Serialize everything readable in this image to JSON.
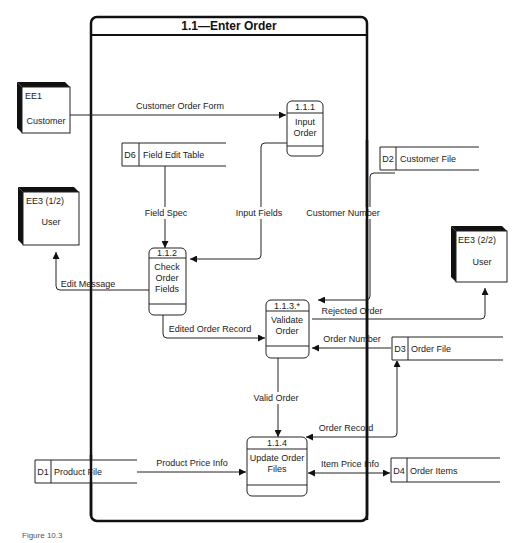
{
  "diagram": {
    "title": "1.1—Enter Order",
    "caption": "Figure 10.3"
  },
  "external_entities": [
    {
      "id": "EE1",
      "name": "Customer"
    },
    {
      "id": "EE3 (1/2)",
      "name": "User"
    },
    {
      "id": "EE3 (2/2)",
      "name": "User"
    }
  ],
  "processes": [
    {
      "id": "1.1.1",
      "name_lines": [
        "Input",
        "Order"
      ]
    },
    {
      "id": "1.1.2",
      "name_lines": [
        "Check",
        "Order",
        "Fields"
      ]
    },
    {
      "id": "1.1.3.*",
      "name_lines": [
        "Validate",
        "Order"
      ]
    },
    {
      "id": "1.1.4",
      "name_lines": [
        "Update Order",
        "Files"
      ]
    }
  ],
  "data_stores": [
    {
      "id": "D6",
      "name": "Field Edit Table"
    },
    {
      "id": "D2",
      "name": "Customer File"
    },
    {
      "id": "D3",
      "name": "Order File"
    },
    {
      "id": "D1",
      "name": "Product File"
    },
    {
      "id": "D4",
      "name": "Order Items"
    }
  ],
  "flows": {
    "customer_order_form": "Customer Order Form",
    "field_spec": "Field Spec",
    "input_fields": "Input Fields",
    "customer_number": "Customer Number",
    "edit_message": "Edit Message",
    "edited_order_record": "Edited Order Record",
    "rejected_order": "Rejected Order",
    "order_number": "Order Number",
    "valid_order": "Valid Order",
    "order_record": "Order Record",
    "product_price_info": "Product Price Info",
    "item_price_info": "Item Price Info"
  }
}
